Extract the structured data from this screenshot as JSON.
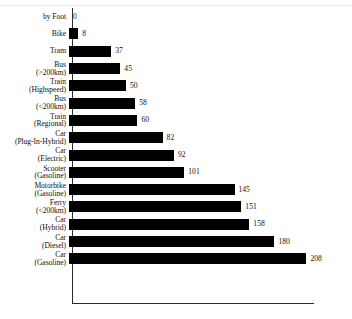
{
  "chart_data": {
    "type": "bar",
    "orientation": "horizontal",
    "title": "",
    "subtitle": "",
    "xlabel": "",
    "ylabel": "",
    "xlim": [
      0,
      212
    ],
    "grid": false,
    "legend": null,
    "bar_color": "#000000",
    "axis_color": "#2b2b2b",
    "value_labels_shown": true,
    "categories": [
      "by Foot",
      "Bike",
      "Tram",
      "Bus\n(>200km)",
      "Train\n(Highspeed)",
      "Bus\n(<200km)",
      "Train\n(Regional)",
      "Car\n(Plug-In-Hybrid)",
      "Car\n(Electric)",
      "Scooter\n(Gasoline)",
      "Motorbike\n(Gasoline)",
      "Ferry\n(<200km)",
      "Car\n(Hybrid)",
      "Car\n(Diesel)",
      "Car\n(Gasoline)"
    ],
    "values": [
      0,
      8,
      37,
      45,
      50,
      58,
      60,
      82,
      92,
      101,
      145,
      151,
      158,
      180,
      208
    ],
    "value_label_texts": [
      "0",
      "8",
      "37",
      "45",
      "50",
      "58",
      "60",
      "82",
      "92",
      "101",
      "145",
      "151",
      "158",
      "180",
      "208"
    ]
  }
}
